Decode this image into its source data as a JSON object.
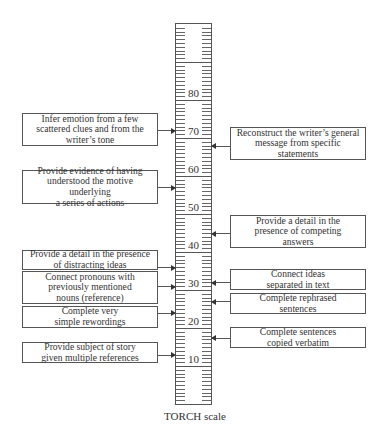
{
  "chart_data": {
    "type": "scale-diagram",
    "title": "TORCH scale",
    "scale": {
      "min": 0,
      "max": 100,
      "major_step": 10,
      "minor_step": 1,
      "labels": [
        10,
        20,
        30,
        40,
        50,
        60,
        70,
        80
      ]
    },
    "left_items": [
      {
        "text": "Infer emotion from a few\nscattered clues and from the\nwriter’s tone",
        "value": 72
      },
      {
        "text": "Provide evidence of having\nunderstood the motive underlying\na series of actions",
        "value": 57
      },
      {
        "text": "Provide a detail in the presence\nof distracting ideas",
        "value": 36
      },
      {
        "text": "Connect pronouns with\npreviously mentioned\nnouns (reference)",
        "value": 31
      },
      {
        "text": "Complete very\nsimple rewordings",
        "value": 24
      },
      {
        "text": "Provide subject of story\ngiven multiple references",
        "value": 13
      }
    ],
    "right_items": [
      {
        "text": "Reconstruct the writer’s general\nmessage from specific\nstatements",
        "value": 68
      },
      {
        "text": "Provide a detail in the\npresence of competing\nanswers",
        "value": 45
      },
      {
        "text": "Connect ideas\nseparated in text",
        "value": 32
      },
      {
        "text": "Complete rephrased\nsentences",
        "value": 27
      },
      {
        "text": "Complete sentences\ncopied verbatim",
        "value": 17.5
      }
    ]
  },
  "caption": "TORCH scale",
  "colors": {
    "line": "#555555",
    "text": "#333333",
    "background": "#ffffff"
  }
}
